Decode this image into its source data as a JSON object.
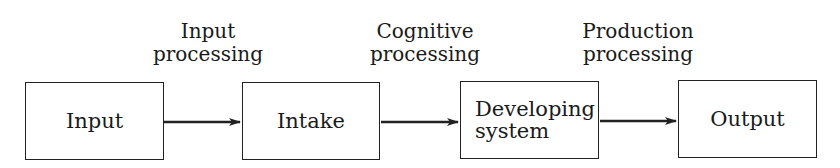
{
  "diagram": {
    "nodes": [
      {
        "id": "input",
        "label": "Input"
      },
      {
        "id": "intake",
        "label": "Intake"
      },
      {
        "id": "developing",
        "label_line1": "Developing",
        "label_line2": "system"
      },
      {
        "id": "output",
        "label": "Output"
      }
    ],
    "edges": [
      {
        "from": "input",
        "to": "intake",
        "label_line1": "Input",
        "label_line2": "processing"
      },
      {
        "from": "intake",
        "to": "developing",
        "label_line1": "Cognitive",
        "label_line2": "processing"
      },
      {
        "from": "developing",
        "to": "output",
        "label_line1": "Production",
        "label_line2": "processing"
      }
    ]
  }
}
